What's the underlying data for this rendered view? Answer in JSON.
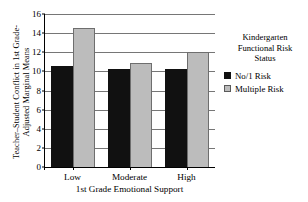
{
  "chart_data": {
    "type": "bar",
    "title": "",
    "xlabel": "1st Grade Emotional Support",
    "ylabel": "Teacher–Student Conflict in 1st Grade-\nAdjusted Marginal Means",
    "categories": [
      "Low",
      "Moderate",
      "High"
    ],
    "series": [
      {
        "name": "No/1 Risk",
        "color": "#111111",
        "values": [
          10.6,
          10.2,
          10.2
        ]
      },
      {
        "name": "Multiple Risk",
        "color": "#bcbcbc",
        "values": [
          14.5,
          10.9,
          12.0
        ]
      }
    ],
    "ylim": [
      0,
      16
    ],
    "yticks": [
      0,
      2,
      4,
      6,
      8,
      10,
      12,
      14,
      16
    ],
    "ytick_labels": [
      "0",
      "2",
      "4",
      "6",
      "8",
      "10",
      "12",
      "14",
      "16"
    ],
    "grid": true,
    "legend_position": "right"
  },
  "legend": {
    "title": "Kindergarten\nFunctional Risk\nStatus",
    "entries": [
      {
        "label": "No/1 Risk",
        "swatch": "dark-square-icon"
      },
      {
        "label": "Multiple Risk",
        "swatch": "light-gray-square-icon"
      }
    ]
  }
}
